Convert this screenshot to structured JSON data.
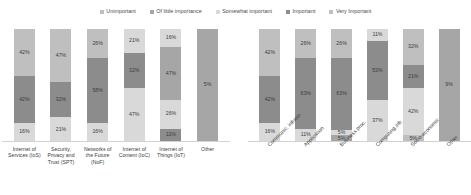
{
  "legend": {
    "position": "top-center",
    "items": [
      {
        "label": "Unimportant",
        "color": "#bfbfbf"
      },
      {
        "label": "Of little importance",
        "color": "#a6a6a6"
      },
      {
        "label": "Somewhat important",
        "color": "#d9d9d9"
      },
      {
        "label": "Important",
        "color": "#8c8c8c"
      },
      {
        "label": "Very Important",
        "color": "#bfbfbf"
      }
    ]
  },
  "colors": {
    "unimportant": "#bfbfbf",
    "of_little_importance": "#a6a6a6",
    "somewhat_important": "#d9d9d9",
    "important": "#8c8c8c",
    "very_important": "#bfbfbf",
    "axis": "#d2d2d2",
    "text": "#3c3c3c"
  },
  "chart_data": [
    {
      "id": "left",
      "type": "bar",
      "subtype": "stacked-100",
      "title": "",
      "xlabel": "",
      "ylabel": "",
      "ylim": [
        0,
        100
      ],
      "grid": false,
      "legend_position": "top-center",
      "categories": [
        "Internet of Services (IoS)",
        "Security, Privacy and Trust (SPT)",
        "Networks of the Future (NoF)",
        "Internet of Content (IoC)",
        "Internet of Things (IoT)",
        "Other"
      ],
      "series": [
        {
          "name": "Very Important",
          "values": [
            42,
            47,
            26,
            21,
            16,
            null
          ]
        },
        {
          "name": "Important",
          "values": [
            42,
            32,
            58,
            32,
            47,
            5
          ]
        },
        {
          "name": "Somewhat important",
          "values": [
            16,
            21,
            16,
            47,
            26,
            null
          ]
        },
        {
          "name": "Of little importance",
          "values": [
            null,
            null,
            null,
            null,
            11,
            null
          ]
        }
      ],
      "bars": [
        {
          "category": "Internet of Services (IoS)",
          "segments": [
            {
              "series": "Very Important",
              "value": 42,
              "label": "42%",
              "color": "#bfbfbf"
            },
            {
              "series": "Important",
              "value": 42,
              "label": "42%",
              "color": "#8c8c8c"
            },
            {
              "series": "Somewhat important",
              "value": 16,
              "label": "16%",
              "color": "#d9d9d9"
            }
          ]
        },
        {
          "category": "Security, Privacy and Trust (SPT)",
          "segments": [
            {
              "series": "Very Important",
              "value": 47,
              "label": "47%",
              "color": "#bfbfbf"
            },
            {
              "series": "Important",
              "value": 32,
              "label": "32%",
              "color": "#8c8c8c"
            },
            {
              "series": "Somewhat important",
              "value": 21,
              "label": "21%",
              "color": "#d9d9d9"
            }
          ]
        },
        {
          "category": "Networks of the Future (NoF)",
          "segments": [
            {
              "series": "Very Important",
              "value": 26,
              "label": "26%",
              "color": "#bfbfbf"
            },
            {
              "series": "Important",
              "value": 58,
              "label": "58%",
              "color": "#8c8c8c"
            },
            {
              "series": "Somewhat important",
              "value": 16,
              "label": "16%",
              "color": "#d9d9d9"
            }
          ]
        },
        {
          "category": "Internet of Content (IoC)",
          "segments": [
            {
              "series": "Very Important",
              "value": 21,
              "label": "21%",
              "color": "#d9d9d9"
            },
            {
              "series": "Important",
              "value": 32,
              "label": "32%",
              "color": "#8c8c8c"
            },
            {
              "series": "Somewhat important",
              "value": 47,
              "label": "47%",
              "color": "#d9d9d9"
            }
          ]
        },
        {
          "category": "Internet of Things (IoT)",
          "segments": [
            {
              "series": "Very Important",
              "value": 16,
              "label": "16%",
              "color": "#d9d9d9"
            },
            {
              "series": "Important",
              "value": 47,
              "label": "47%",
              "color": "#a6a6a6"
            },
            {
              "series": "Somewhat important",
              "value": 26,
              "label": "26%",
              "color": "#d9d9d9"
            },
            {
              "series": "Of little importance",
              "value": 11,
              "label": "11%",
              "color": "#8c8c8c"
            }
          ]
        },
        {
          "category": "Other",
          "segments": [
            {
              "series": "Important",
              "value": 100,
              "label": "5%",
              "color": "#a6a6a6"
            }
          ]
        }
      ]
    },
    {
      "id": "right",
      "type": "bar",
      "subtype": "stacked-100",
      "title": "",
      "xlabel": "",
      "ylabel": "",
      "ylim": [
        0,
        100
      ],
      "grid": false,
      "legend_position": "top-center",
      "categories": [
        "Communic. infrastr.",
        "Application",
        "Business proc.",
        "Computing infr.",
        "Socio-economic",
        "Other"
      ],
      "series": [
        {
          "name": "Very Important",
          "values": [
            42,
            26,
            26,
            11,
            32,
            null
          ]
        },
        {
          "name": "Important",
          "values": [
            42,
            63,
            63,
            53,
            21,
            9
          ]
        },
        {
          "name": "Somewhat important",
          "values": [
            16,
            11,
            5,
            37,
            42,
            null
          ]
        },
        {
          "name": "Of little importance",
          "values": [
            null,
            null,
            5,
            null,
            5,
            null
          ]
        }
      ],
      "bars": [
        {
          "category": "Communic. infrastr.",
          "segments": [
            {
              "series": "Very Important",
              "value": 42,
              "label": "42%",
              "color": "#bfbfbf"
            },
            {
              "series": "Important",
              "value": 42,
              "label": "42%",
              "color": "#8c8c8c"
            },
            {
              "series": "Somewhat important",
              "value": 16,
              "label": "16%",
              "color": "#d9d9d9"
            }
          ]
        },
        {
          "category": "Application",
          "segments": [
            {
              "series": "Very Important",
              "value": 26,
              "label": "26%",
              "color": "#bfbfbf"
            },
            {
              "series": "Important",
              "value": 63,
              "label": "63%",
              "color": "#8c8c8c"
            },
            {
              "series": "Somewhat important",
              "value": 11,
              "label": "11%",
              "color": "#d9d9d9"
            }
          ]
        },
        {
          "category": "Business proc.",
          "segments": [
            {
              "series": "Very Important",
              "value": 26,
              "label": "26%",
              "color": "#bfbfbf"
            },
            {
              "series": "Important",
              "value": 63,
              "label": "63%",
              "color": "#8c8c8c"
            },
            {
              "series": "Somewhat important",
              "value": 5,
              "label": "5%",
              "color": "#d9d9d9"
            },
            {
              "series": "Of little importance",
              "value": 5,
              "label": "5%",
              "color": "#a6a6a6"
            }
          ]
        },
        {
          "category": "Computing infr.",
          "segments": [
            {
              "series": "Very Important",
              "value": 11,
              "label": "11%",
              "color": "#d9d9d9"
            },
            {
              "series": "Important",
              "value": 53,
              "label": "53%",
              "color": "#8c8c8c"
            },
            {
              "series": "Somewhat important",
              "value": 37,
              "label": "37%",
              "color": "#d9d9d9"
            }
          ]
        },
        {
          "category": "Socio-economic",
          "segments": [
            {
              "series": "Very Important",
              "value": 32,
              "label": "32%",
              "color": "#bfbfbf"
            },
            {
              "series": "Important",
              "value": 21,
              "label": "21%",
              "color": "#8c8c8c"
            },
            {
              "series": "Somewhat important",
              "value": 42,
              "label": "42%",
              "color": "#d9d9d9"
            },
            {
              "series": "Of little importance",
              "value": 5,
              "label": "5%",
              "color": "#bfbfbf"
            }
          ]
        },
        {
          "category": "Other",
          "segments": [
            {
              "series": "Important",
              "value": 100,
              "label": "9%",
              "color": "#a6a6a6"
            }
          ]
        }
      ]
    }
  ]
}
